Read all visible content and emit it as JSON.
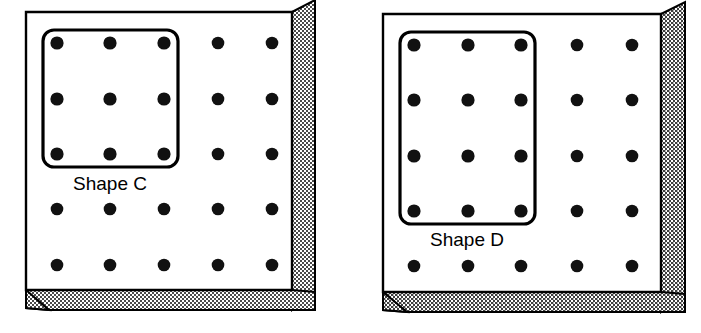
{
  "figure": {
    "type": "pegboard-shapes-diagram",
    "background_color": "#ffffff",
    "ink_color": "#000000",
    "board_face_color": "#ffffff",
    "board_edge_color": "#000000",
    "edge_texture": "stipple-dots",
    "edge_texture_color": "#555555"
  },
  "boards": [
    {
      "id": "board-c",
      "name": "left-pegboard",
      "grid": {
        "columns": 5,
        "rows": 5
      },
      "peg_color": "#111111",
      "peg_radius": 6.5,
      "face": {
        "x": 26,
        "y": 12,
        "width": 266,
        "height": 278
      },
      "bevel_depth": 23,
      "shape": {
        "label": "Shape C",
        "outline": "rounded-rectangle",
        "covers_columns": 3,
        "covers_rows": 3,
        "peg_count": 9,
        "x": 43,
        "y": 30,
        "width": 135,
        "height": 137,
        "corner_radius": 10,
        "stroke_width": 3.2,
        "label_x": 110,
        "label_y": 190
      }
    },
    {
      "id": "board-d",
      "name": "right-pegboard",
      "grid": {
        "columns": 5,
        "rows": 5
      },
      "peg_color": "#111111",
      "peg_radius": 6.5,
      "face": {
        "x": 383,
        "y": 14,
        "width": 278,
        "height": 278
      },
      "bevel_depth": 23,
      "shape": {
        "label": "Shape D",
        "outline": "rounded-rectangle",
        "covers_columns": 3,
        "covers_rows": 4,
        "peg_count": 12,
        "x": 400,
        "y": 32,
        "width": 135,
        "height": 192,
        "corner_radius": 10,
        "stroke_width": 3.2,
        "label_x": 467,
        "label_y": 246
      }
    }
  ],
  "pegs": {
    "board-c": {
      "columns_x": [
        57,
        110,
        164,
        218,
        272
      ],
      "rows_y": [
        43,
        99,
        154,
        209,
        265
      ]
    },
    "board-d": {
      "columns_x": [
        414,
        468,
        521,
        577,
        632
      ],
      "rows_y": [
        45,
        100,
        156,
        211,
        266
      ]
    }
  },
  "labels": {
    "shape_c": "Shape C",
    "shape_d": "Shape D"
  }
}
